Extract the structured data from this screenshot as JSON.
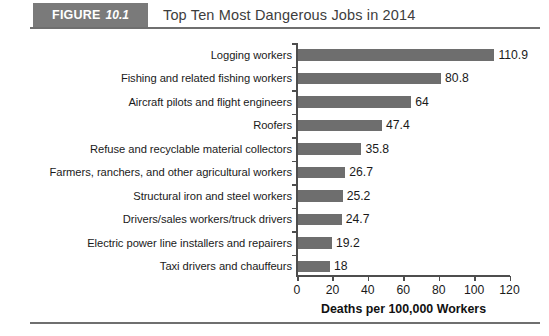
{
  "figure": {
    "badge_keyword": "FIGURE",
    "badge_number": "10.1",
    "title": "Top Ten Most Dangerous Jobs in 2014",
    "badge_color": "#7a7a7a",
    "rule_color": "#6f6f6f"
  },
  "chart_data": {
    "type": "bar",
    "orientation": "horizontal",
    "title": "Top Ten Most Dangerous Jobs in 2014",
    "xlabel": "Deaths per 100,000 Workers",
    "ylabel": "",
    "xlim": [
      0,
      120
    ],
    "xticks": [
      0,
      20,
      40,
      60,
      80,
      100,
      120
    ],
    "xtick_labels": [
      "0",
      "20",
      "40",
      "60",
      "80",
      "100",
      "120"
    ],
    "grid": false,
    "legend": false,
    "bar_color": "#6e6e6e",
    "categories": [
      "Logging workers",
      "Fishing and related fishing workers",
      "Aircraft pilots and flight engineers",
      "Roofers",
      "Refuse and recyclable material collectors",
      "Farmers, ranchers, and other agricultural workers",
      "Structural iron and steel workers",
      "Drivers/sales workers/truck drivers",
      "Electric power line installers and repairers",
      "Taxi drivers and chauffeurs"
    ],
    "values": [
      110.9,
      80.8,
      64,
      47.4,
      35.8,
      26.7,
      25.2,
      24.7,
      19.2,
      18
    ],
    "value_labels": [
      "110.9",
      "80.8",
      "64",
      "47.4",
      "35.8",
      "26.7",
      "25.2",
      "24.7",
      "19.2",
      "18"
    ]
  }
}
